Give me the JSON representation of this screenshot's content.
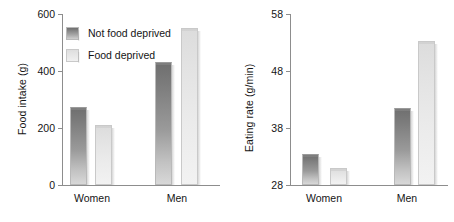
{
  "figure": {
    "legend": {
      "position": "upper-left-of-left-panel",
      "entries": [
        {
          "label": "Not food deprived",
          "swatch": "dark-gray-gradient",
          "color": "#8a8a8a"
        },
        {
          "label": "Food deprived",
          "swatch": "light-gray-gradient",
          "color": "#e6e6e6"
        }
      ]
    }
  },
  "chart_data": [
    {
      "type": "bar",
      "title": "",
      "xlabel": "",
      "ylabel": "Food intake (g)",
      "categories": [
        "Women",
        "Men"
      ],
      "ylim": [
        0,
        600
      ],
      "yticks": [
        0,
        200,
        400,
        600
      ],
      "grid": false,
      "series": [
        {
          "name": "Not food deprived",
          "color": "#8a8a8a",
          "values": [
            275,
            430
          ]
        },
        {
          "name": "Food deprived",
          "color": "#e6e6e6",
          "values": [
            210,
            550
          ]
        }
      ]
    },
    {
      "type": "bar",
      "title": "",
      "xlabel": "",
      "ylabel": "Eating rate (g/min)",
      "categories": [
        "Women",
        "Men"
      ],
      "ylim": [
        28,
        58
      ],
      "yticks": [
        28,
        38,
        48,
        58
      ],
      "grid": false,
      "series": [
        {
          "name": "Not food deprived",
          "color": "#8a8a8a",
          "values": [
            33.5,
            41.5
          ]
        },
        {
          "name": "Food deprived",
          "color": "#e6e6e6",
          "values": [
            31.0,
            53.2
          ]
        }
      ]
    }
  ]
}
